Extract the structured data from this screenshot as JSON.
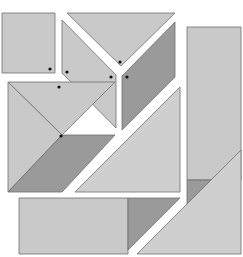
{
  "colors": {
    "background": "#ffffff",
    "light": "#c9c9c9",
    "lighter": "#cfcfcf",
    "dark": "#9a9a9a",
    "stroke": "#6e6e6e",
    "dot": "#111111"
  },
  "pieces": [
    {
      "name": "square-top-left",
      "tone": "light",
      "points": "2,13 55,13 55,73 2,73"
    },
    {
      "name": "triangle-top",
      "tone": "light",
      "points": "67,13 175,13 121,66"
    },
    {
      "name": "parallelogram-upper-left",
      "tone": "light",
      "points": "62,20 116,75 116,128 62,73"
    },
    {
      "name": "parallelogram-upper-right",
      "tone": "dark",
      "points": "175,22 175,77 122,130 122,76"
    },
    {
      "name": "rectangle-tall-right",
      "tone": "light",
      "points": "187,27 241,27 241,180 187,180"
    },
    {
      "name": "triangle-right-dark",
      "tone": "dark",
      "points": "187,180 241,180 187,234"
    },
    {
      "name": "triangle-left-top",
      "tone": "light",
      "points": "8,82 115,82 62,135"
    },
    {
      "name": "triangle-left-side",
      "tone": "light",
      "points": "8,82 62,135 8,192"
    },
    {
      "name": "parallelogram-left-dark",
      "tone": "dark",
      "points": "8,192 62,135 115,135 62,192"
    },
    {
      "name": "triangle-center-large",
      "tone": "lighter",
      "points": "75,192 180,87 180,192"
    },
    {
      "name": "rectangle-bottom",
      "tone": "light",
      "points": "19,198 128,198 128,254 19,254"
    },
    {
      "name": "triangle-bottom-dark",
      "tone": "dark",
      "points": "128,198 180,198 128,250"
    },
    {
      "name": "triangle-bottom-right",
      "tone": "lighter",
      "points": "137,254 241,150 241,254"
    }
  ],
  "dots": [
    {
      "name": "dot-square",
      "cx": 50,
      "cy": 69
    },
    {
      "name": "dot-triangle-top",
      "cx": 120,
      "cy": 62
    },
    {
      "name": "dot-parallelogram-left",
      "cx": 67,
      "cy": 72
    },
    {
      "name": "dot-parallelogram-left-right",
      "cx": 111,
      "cy": 77
    },
    {
      "name": "dot-parallelogram-right",
      "cx": 127,
      "cy": 77
    },
    {
      "name": "dot-left-top",
      "cx": 59,
      "cy": 87
    },
    {
      "name": "dot-left-center",
      "cx": 61,
      "cy": 136
    }
  ]
}
